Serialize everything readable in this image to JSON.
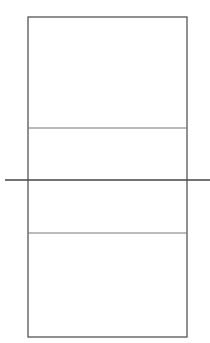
{
  "diagram": {
    "type": "volleyball-court",
    "colors": {
      "background": "#ffffff",
      "boundary": "#555555",
      "attack_line": "#777777",
      "net": "#444444"
    },
    "court": {
      "x": 28,
      "y": 17,
      "width": 159,
      "height": 320
    },
    "net": {
      "x1": 5,
      "x2": 210,
      "y": 180
    },
    "attack_lines": [
      {
        "name": "top-attack-line",
        "y": 128
      },
      {
        "name": "bottom-attack-line",
        "y": 233
      }
    ]
  }
}
